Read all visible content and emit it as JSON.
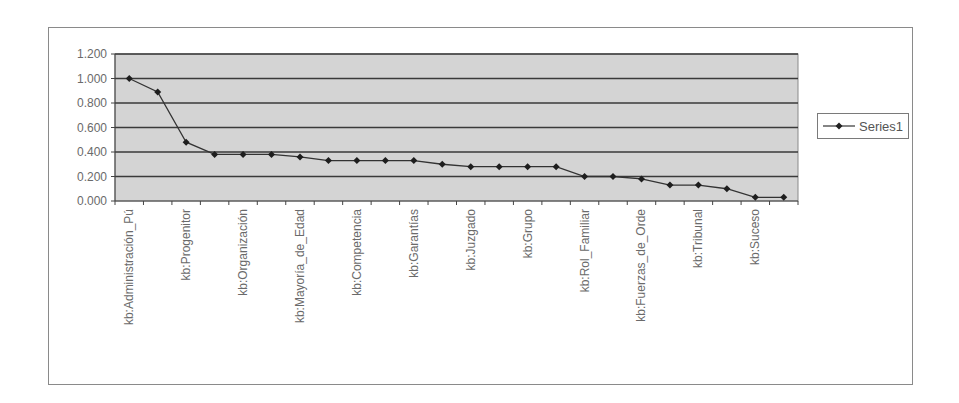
{
  "chart_data": {
    "type": "line",
    "title": "",
    "xlabel": "",
    "ylabel": "",
    "ylim": [
      0,
      1.2
    ],
    "yticks": [
      "0.000",
      "0.200",
      "0.400",
      "0.600",
      "0.800",
      "1.000",
      "1.200"
    ],
    "grid": true,
    "legend_position": "right",
    "plot_background": "#d4d4d4",
    "line_color": "#333333",
    "categories": [
      "kb:Administración_Pú",
      "",
      "kb:Progenitor",
      "",
      "kb:Organización",
      "",
      "kb:Mayoría_de_Edad",
      "",
      "kb:Competencia",
      "",
      "kb:Garantías",
      "",
      "kb:Juzgado",
      "",
      "kb:Grupo",
      "",
      "kb:Rol_Familiar",
      "",
      "kb:Fuerzas_de_Orde",
      "",
      "kb:Tribunal",
      "",
      "kb:Suceso",
      ""
    ],
    "visible_tick_labels": [
      "kb:Administración_Pú",
      "kb:Progenitor",
      "kb:Organización",
      "kb:Mayoría_de_Edad",
      "kb:Competencia",
      "kb:Garantías",
      "kb:Juzgado",
      "kb:Grupo",
      "kb:Rol_Familiar",
      "kb:Fuerzas_de_Orde",
      "kb:Tribunal",
      "kb:Suceso"
    ],
    "series": [
      {
        "name": "Series1",
        "values": [
          1.0,
          0.89,
          0.48,
          0.38,
          0.38,
          0.38,
          0.36,
          0.33,
          0.33,
          0.33,
          0.33,
          0.3,
          0.28,
          0.28,
          0.28,
          0.28,
          0.2,
          0.2,
          0.18,
          0.13,
          0.13,
          0.1,
          0.03,
          0.03
        ]
      }
    ]
  },
  "legend": {
    "label": "Series1"
  }
}
